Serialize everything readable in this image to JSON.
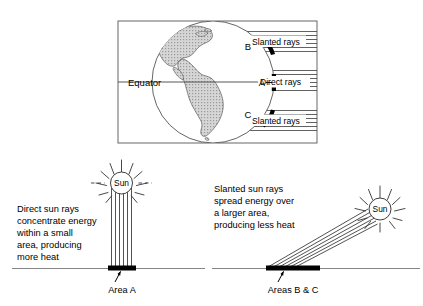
{
  "diagram": {
    "title_visible": false,
    "colors": {
      "ink": "#000000",
      "frame": "#555555",
      "land_fill": "#b8b8b8",
      "ray_line": "#333333",
      "ground_line": "#666666",
      "background": "#ffffff"
    },
    "globe_panel": {
      "name": "globe-frame",
      "equator_label": "Equator",
      "point_labels": [
        {
          "id": "B",
          "label": "B"
        },
        {
          "id": "A",
          "label": "A"
        },
        {
          "id": "C",
          "label": "C"
        }
      ],
      "ray_bands": [
        {
          "id": "band-b",
          "label": "Slanted rays",
          "line_count": 6
        },
        {
          "id": "band-a",
          "label": "Direct rays",
          "line_count": 6
        },
        {
          "id": "band-c",
          "label": "Slanted rays",
          "line_count": 6
        }
      ]
    },
    "left_panel": {
      "name": "direct-rays-panel",
      "sun_label": "Sun",
      "caption_lines": [
        "Direct sun rays",
        "concentrate energy",
        "within a small",
        "area, producing",
        "more heat"
      ],
      "area_label": "Area A",
      "ray_count": 6
    },
    "right_panel": {
      "name": "slanted-rays-panel",
      "sun_label": "Sun",
      "caption_lines": [
        "Slanted sun rays",
        "spread energy over",
        "a larger area,",
        "producing less heat"
      ],
      "area_label": "Areas B & C",
      "ray_count": 6
    }
  }
}
